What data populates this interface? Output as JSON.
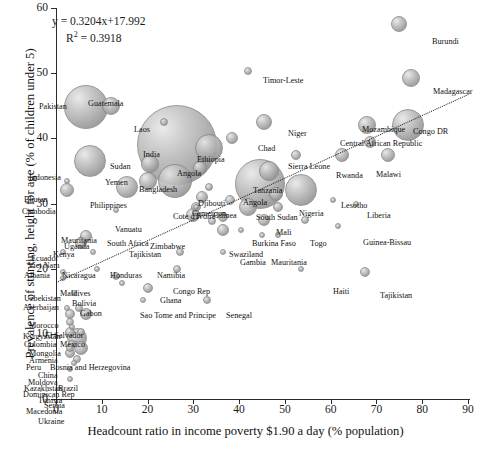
{
  "chart_data": {
    "type": "scatter",
    "title": "",
    "xlabel": "Headcount ratio in income poverty $1.90 a day (% population)",
    "ylabel": "Prevalence of stunting, height for age (% of children under 5)",
    "xlim": [
      0,
      90
    ],
    "ylim": [
      0,
      60
    ],
    "xticks": [
      0,
      10,
      20,
      30,
      40,
      50,
      60,
      70,
      80,
      90
    ],
    "yticks": [
      0,
      10,
      20,
      30,
      40,
      50,
      60
    ],
    "grid": false,
    "legend": false,
    "annotations": {
      "equation": "y = 0.3204x+17.992",
      "r_squared_label": "R",
      "r_squared_sup": "2",
      "r_squared_value": "= 0.3918",
      "slope": 0.3204,
      "intercept": 17.992,
      "r2": 0.3918
    },
    "trendline": {
      "type": "linear-dotted",
      "x0": 0,
      "y0": 17.992,
      "x1": 90,
      "y1": 46.828
    },
    "bubble_size_meaning": "population / number of stunted children",
    "points": [
      {
        "name": "Burundi",
        "x": 75.0,
        "y": 57.5,
        "r": 8
      },
      {
        "name": "Timor-Leste",
        "x": 42.0,
        "y": 50.3,
        "r": 4
      },
      {
        "name": "Madagascar",
        "x": 77.5,
        "y": 49.2,
        "r": 9
      },
      {
        "name": "Pakistan",
        "x": 6.5,
        "y": 44.8,
        "r": 22
      },
      {
        "name": "Guatemala",
        "x": 12.0,
        "y": 45.0,
        "r": 9
      },
      {
        "name": "Laos",
        "x": 23.5,
        "y": 42.5,
        "r": 4
      },
      {
        "name": "Mozambique",
        "x": 68.0,
        "y": 42.0,
        "r": 9
      },
      {
        "name": "Congo DR",
        "x": 77.0,
        "y": 42.0,
        "r": 16
      },
      {
        "name": "India",
        "x": 26.5,
        "y": 39.0,
        "r": 40
      },
      {
        "name": "Niger",
        "x": 45.5,
        "y": 42.5,
        "r": 8
      },
      {
        "name": "Chad",
        "x": 38.5,
        "y": 40.0,
        "r": 6
      },
      {
        "name": "Central African Republic",
        "x": 68.5,
        "y": 39.5,
        "r": 6
      },
      {
        "name": "Ethiopia",
        "x": 33.5,
        "y": 38.5,
        "r": 14
      },
      {
        "name": "Indonesia",
        "x": 7.5,
        "y": 36.5,
        "r": 16
      },
      {
        "name": "Sudan",
        "x": 20.5,
        "y": 36.0,
        "r": 9
      },
      {
        "name": "Rwanda",
        "x": 62.5,
        "y": 37.5,
        "r": 7
      },
      {
        "name": "Malawi",
        "x": 72.5,
        "y": 37.5,
        "r": 7
      },
      {
        "name": "Sierra Leone",
        "x": 52.5,
        "y": 37.5,
        "r": 5
      },
      {
        "name": "Angola",
        "x": 31.5,
        "y": 35.5,
        "r": 7
      },
      {
        "name": "Bangladesh",
        "x": 26.0,
        "y": 33.5,
        "r": 17
      },
      {
        "name": "Yemen",
        "x": 20.0,
        "y": 33.5,
        "r": 9
      },
      {
        "name": "Tanzania",
        "x": 46.5,
        "y": 35.0,
        "r": 10
      },
      {
        "name": "Bhutan",
        "x": 2.5,
        "y": 33.5,
        "r": 3
      },
      {
        "name": "Philippines",
        "x": 15.5,
        "y": 32.5,
        "r": 11
      },
      {
        "name": "Cambodia",
        "x": 2.5,
        "y": 32.0,
        "r": 7
      },
      {
        "name": "Djibouti",
        "x": 33.5,
        "y": 32.5,
        "r": 4
      },
      {
        "name": "Cameroon",
        "x": 32.0,
        "y": 31.0,
        "r": 6
      },
      {
        "name": "Angola2",
        "x": 44.5,
        "y": 33.0,
        "r": 25
      },
      {
        "name": "South Sudan",
        "x": 48.0,
        "y": 31.5,
        "r": 7
      },
      {
        "name": "Nigeria",
        "x": 53.5,
        "y": 32.0,
        "r": 16
      },
      {
        "name": "Lesotho",
        "x": 60.5,
        "y": 30.5,
        "r": 3
      },
      {
        "name": "Liberia",
        "x": 65.5,
        "y": 30.0,
        "r": 3
      },
      {
        "name": "Guinea",
        "x": 38.0,
        "y": 30.5,
        "r": 5
      },
      {
        "name": "Cote d'Ivoire",
        "x": 30.5,
        "y": 29.5,
        "r": 5
      },
      {
        "name": "Mauritania",
        "x": 13.0,
        "y": 29.0,
        "r": 3
      },
      {
        "name": "Vanuatu",
        "x": 30.5,
        "y": 29.5,
        "r": 3
      },
      {
        "name": "South Africa",
        "x": 30.0,
        "y": 28.2,
        "r": 7
      },
      {
        "name": "Zimbabwe",
        "x": 36.5,
        "y": 28.0,
        "r": 5
      },
      {
        "name": "Tajikistan2",
        "x": 34.0,
        "y": 27.3,
        "r": 4
      },
      {
        "name": "Uganda",
        "x": 42.0,
        "y": 29.5,
        "r": 9
      },
      {
        "name": "Mali",
        "x": 48.5,
        "y": 29.5,
        "r": 5
      },
      {
        "name": "Burkina Faso",
        "x": 45.5,
        "y": 27.5,
        "r": 6
      },
      {
        "name": "Togo",
        "x": 54.5,
        "y": 27.5,
        "r": 4
      },
      {
        "name": "Kenya",
        "x": 36.5,
        "y": 26.0,
        "r": 6
      },
      {
        "name": "Swaziland",
        "x": 40.5,
        "y": 26.0,
        "r": 3
      },
      {
        "name": "Gambia",
        "x": 45.0,
        "y": 25.2,
        "r": 3
      },
      {
        "name": "Mauritania2",
        "x": 48.5,
        "y": 25.2,
        "r": 3
      },
      {
        "name": "Guinea-Bissau",
        "x": 61.5,
        "y": 26.5,
        "r": 3
      },
      {
        "name": "Ecuador",
        "x": 6.5,
        "y": 25.0,
        "r": 6
      },
      {
        "name": "Viet Nam",
        "x": 5.5,
        "y": 24.0,
        "r": 6
      },
      {
        "name": "Albania",
        "x": 1.5,
        "y": 22.5,
        "r": 3
      },
      {
        "name": "Nicaragua",
        "x": 8.0,
        "y": 22.5,
        "r": 3
      },
      {
        "name": "Honduras",
        "x": 27.0,
        "y": 22.5,
        "r": 4
      },
      {
        "name": "Namibia",
        "x": 36.5,
        "y": 22.5,
        "r": 3
      },
      {
        "name": "Congo Rep",
        "x": 26.5,
        "y": 20.0,
        "r": 4
      },
      {
        "name": "Haiti",
        "x": 53.5,
        "y": 20.0,
        "r": 3
      },
      {
        "name": "Tajikistan",
        "x": 67.5,
        "y": 19.5,
        "r": 5
      },
      {
        "name": "Maldives",
        "x": 9.0,
        "y": 20.0,
        "r": 3
      },
      {
        "name": "Uzbekistan",
        "x": 1.5,
        "y": 19.5,
        "r": 3
      },
      {
        "name": "Bolivia",
        "x": 13.0,
        "y": 18.8,
        "r": 4
      },
      {
        "name": "Azerbaijan",
        "x": 1.5,
        "y": 18.5,
        "r": 3
      },
      {
        "name": "Gabon",
        "x": 14.5,
        "y": 17.8,
        "r": 3
      },
      {
        "name": "Ghana",
        "x": 20.0,
        "y": 17.0,
        "r": 5
      },
      {
        "name": "Morocco",
        "x": 4.0,
        "y": 16.2,
        "r": 3
      },
      {
        "name": "Sao Tome and Principe",
        "x": 19.0,
        "y": 15.2,
        "r": 3
      },
      {
        "name": "Senegal",
        "x": 33.0,
        "y": 15.2,
        "r": 4
      },
      {
        "name": "Kyrgyzstan",
        "x": 2.5,
        "y": 14.0,
        "r": 3
      },
      {
        "name": "El Salvador",
        "x": 5.0,
        "y": 14.0,
        "r": 4
      },
      {
        "name": "Colombia",
        "x": 3.0,
        "y": 13.0,
        "r": 5
      },
      {
        "name": "Mexico",
        "x": 6.5,
        "y": 13.0,
        "r": 6
      },
      {
        "name": "Mongolia",
        "x": 3.0,
        "y": 11.8,
        "r": 4
      },
      {
        "name": "Armenia",
        "x": 3.5,
        "y": 11.0,
        "r": 3
      },
      {
        "name": "Bosnia and Herzegovina",
        "x": 5.5,
        "y": 10.3,
        "r": 4
      },
      {
        "name": "Peru",
        "x": 3.0,
        "y": 10.3,
        "r": 5
      },
      {
        "name": "China",
        "x": 4.5,
        "y": 9.3,
        "r": 10
      },
      {
        "name": "Moldova",
        "x": 3.5,
        "y": 8.5,
        "r": 4
      },
      {
        "name": "Kazakhstan",
        "x": 3.0,
        "y": 7.8,
        "r": 4
      },
      {
        "name": "Brazil",
        "x": 5.5,
        "y": 7.8,
        "r": 7
      },
      {
        "name": "Dominican Rep",
        "x": 3.0,
        "y": 7.0,
        "r": 5
      },
      {
        "name": "Tunisia",
        "x": 4.5,
        "y": 6.2,
        "r": 4
      },
      {
        "name": "Serbia",
        "x": 4.0,
        "y": 5.5,
        "r": 3
      },
      {
        "name": "Macedonia",
        "x": 3.0,
        "y": 4.6,
        "r": 3
      },
      {
        "name": "Ukraine",
        "x": 3.0,
        "y": 3.0,
        "r": 3
      }
    ],
    "labels": [
      {
        "text": "Burundi",
        "x": 432,
        "y": 38
      },
      {
        "text": "Timor-Leste",
        "x": 263,
        "y": 77
      },
      {
        "text": "Madagascar",
        "x": 433,
        "y": 88
      },
      {
        "text": "Pakistan",
        "x": 39,
        "y": 103
      },
      {
        "text": "Guatemala",
        "x": 88,
        "y": 100
      },
      {
        "text": "Laos",
        "x": 134,
        "y": 126
      },
      {
        "text": "Mozambique",
        "x": 362,
        "y": 126
      },
      {
        "text": "Congo DR",
        "x": 413,
        "y": 128
      },
      {
        "text": "India",
        "x": 143,
        "y": 151
      },
      {
        "text": "Niger",
        "x": 288,
        "y": 130
      },
      {
        "text": "Chad",
        "x": 258,
        "y": 145
      },
      {
        "text": "Central African Republic",
        "x": 340,
        "y": 140
      },
      {
        "text": "Ethiopia",
        "x": 197,
        "y": 156
      },
      {
        "text": "Indonesia",
        "x": 29,
        "y": 174
      },
      {
        "text": "Sudan",
        "x": 110,
        "y": 163
      },
      {
        "text": "Rwanda",
        "x": 336,
        "y": 172
      },
      {
        "text": "Malawi",
        "x": 376,
        "y": 171
      },
      {
        "text": "Sierra Leone",
        "x": 288,
        "y": 163
      },
      {
        "text": "Angola",
        "x": 177,
        "y": 170
      },
      {
        "text": "Bangladesh",
        "x": 139,
        "y": 186
      },
      {
        "text": "Yemen",
        "x": 105,
        "y": 179
      },
      {
        "text": "Tanzania",
        "x": 253,
        "y": 187
      },
      {
        "text": "Bhutan",
        "x": 24,
        "y": 196
      },
      {
        "text": "Philippines",
        "x": 90,
        "y": 202
      },
      {
        "text": "Cambodia",
        "x": 22,
        "y": 208
      },
      {
        "text": "Djibouti",
        "x": 198,
        "y": 200
      },
      {
        "text": "Cameroon",
        "x": 192,
        "y": 210
      },
      {
        "text": "Angola2",
        "x": 243,
        "y": 199
      },
      {
        "text": "South Sudan",
        "x": 256,
        "y": 214
      },
      {
        "text": "Nigeria",
        "x": 299,
        "y": 210
      },
      {
        "text": "Lesotho",
        "x": 341,
        "y": 202
      },
      {
        "text": "Liberia",
        "x": 367,
        "y": 212
      },
      {
        "text": "Guinea",
        "x": 213,
        "y": 212
      },
      {
        "text": "Cote d'Ivoire",
        "x": 173,
        "y": 213
      },
      {
        "text": "Mauritania",
        "x": 61,
        "y": 237
      },
      {
        "text": "Vanuatu",
        "x": 115,
        "y": 226
      },
      {
        "text": "South Africa",
        "x": 107,
        "y": 240
      },
      {
        "text": "Zimbabwe",
        "x": 150,
        "y": 243
      },
      {
        "text": "Tajikistan2",
        "x": 129,
        "y": 251
      },
      {
        "text": "Uganda",
        "x": 64,
        "y": 243
      },
      {
        "text": "Mali",
        "x": 276,
        "y": 229
      },
      {
        "text": "Burkina Faso",
        "x": 252,
        "y": 240
      },
      {
        "text": "Togo",
        "x": 310,
        "y": 240
      },
      {
        "text": "Kenya",
        "x": 53,
        "y": 251
      },
      {
        "text": "Swaziland",
        "x": 229,
        "y": 251
      },
      {
        "text": "Gambia",
        "x": 240,
        "y": 259
      },
      {
        "text": "Mauritania2",
        "x": 271,
        "y": 259
      },
      {
        "text": "Guinea-Bissau",
        "x": 363,
        "y": 239
      },
      {
        "text": "Ecuador",
        "x": 31,
        "y": 255
      },
      {
        "text": "Viet Nam",
        "x": 28,
        "y": 262
      },
      {
        "text": "Albania",
        "x": 24,
        "y": 272
      },
      {
        "text": "Nicaragua",
        "x": 62,
        "y": 272
      },
      {
        "text": "Honduras",
        "x": 110,
        "y": 272
      },
      {
        "text": "Namibia",
        "x": 157,
        "y": 272
      },
      {
        "text": "Congo Rep",
        "x": 173,
        "y": 288
      },
      {
        "text": "Haiti",
        "x": 333,
        "y": 288
      },
      {
        "text": "Tajikistan",
        "x": 380,
        "y": 292
      },
      {
        "text": "Maldives",
        "x": 60,
        "y": 290
      },
      {
        "text": "Uzbekistan",
        "x": 24,
        "y": 295
      },
      {
        "text": "Bolivia",
        "x": 72,
        "y": 300
      },
      {
        "text": "Azerbaijan",
        "x": 23,
        "y": 304
      },
      {
        "text": "Gabon",
        "x": 80,
        "y": 310
      },
      {
        "text": "Ghana",
        "x": 160,
        "y": 297
      },
      {
        "text": "Morocco",
        "x": 29,
        "y": 322
      },
      {
        "text": "Sao Tome and Principe",
        "x": 140,
        "y": 312
      },
      {
        "text": "Senegal",
        "x": 226,
        "y": 312
      },
      {
        "text": "Kyrgyzstan",
        "x": 23,
        "y": 333
      },
      {
        "text": "El Salvador",
        "x": 45,
        "y": 332
      },
      {
        "text": "Colombia",
        "x": 24,
        "y": 341
      },
      {
        "text": "Mexico",
        "x": 60,
        "y": 341
      },
      {
        "text": "Mongolia",
        "x": 29,
        "y": 350
      },
      {
        "text": "Armenia",
        "x": 29,
        "y": 357
      },
      {
        "text": "Bosnia and Herzegovina",
        "x": 50,
        "y": 364
      },
      {
        "text": "Peru",
        "x": 26,
        "y": 364
      },
      {
        "text": "China",
        "x": 38,
        "y": 372
      },
      {
        "text": "Moldova",
        "x": 28,
        "y": 379
      },
      {
        "text": "Kazakhstan",
        "x": 24,
        "y": 385
      },
      {
        "text": "Brazil",
        "x": 58,
        "y": 385
      },
      {
        "text": "Dominican Rep",
        "x": 23,
        "y": 391
      },
      {
        "text": "Tunisia",
        "x": 38,
        "y": 397
      },
      {
        "text": "Serbia",
        "x": 44,
        "y": 402
      },
      {
        "text": "Macedonia",
        "x": 26,
        "y": 408
      },
      {
        "text": "Ukraine",
        "x": 38,
        "y": 418
      }
    ]
  }
}
